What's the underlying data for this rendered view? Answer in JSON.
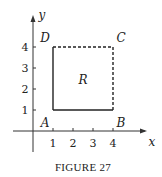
{
  "figure": {
    "caption": "FIGURE 27",
    "axes": {
      "x_label": "x",
      "y_label": "y",
      "x_ticks": [
        "1",
        "2",
        "3",
        "4"
      ],
      "y_ticks": [
        "1",
        "2",
        "3",
        "4"
      ]
    },
    "region_label": "R",
    "vertices": [
      {
        "name": "A",
        "x": 1,
        "y": 1
      },
      {
        "name": "B",
        "x": 4,
        "y": 1
      },
      {
        "name": "C",
        "x": 4,
        "y": 4
      },
      {
        "name": "D",
        "x": 1,
        "y": 4
      }
    ],
    "edges": [
      {
        "from": "A",
        "to": "B",
        "style": "solid"
      },
      {
        "from": "B",
        "to": "C",
        "style": "dashed"
      },
      {
        "from": "C",
        "to": "D",
        "style": "dashed"
      },
      {
        "from": "D",
        "to": "A",
        "style": "solid"
      }
    ]
  }
}
